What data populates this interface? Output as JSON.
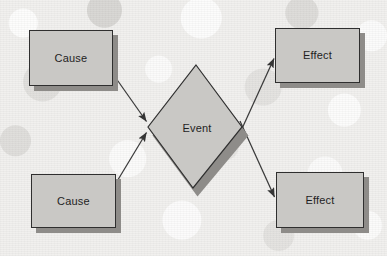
{
  "diagram": {
    "type": "cause-event-effect",
    "background_color": "#f1f0ee",
    "node_fill_color": "#c9c8c5",
    "node_border_color": "#2f2f2f",
    "node_shadow_color": "#8e8c89",
    "connector_color": "#3a3a3a",
    "nodes": [
      {
        "id": "cause-top",
        "label": "Cause",
        "shape": "rectangle",
        "x": 29,
        "y": 30,
        "width": 84,
        "height": 56
      },
      {
        "id": "cause-bottom",
        "label": "Cause",
        "shape": "rectangle",
        "x": 31,
        "y": 174,
        "width": 85,
        "height": 54
      },
      {
        "id": "event",
        "label": "Event",
        "shape": "diamond",
        "x": 148,
        "y": 65,
        "width": 94,
        "height": 123
      },
      {
        "id": "effect-top",
        "label": "Effect",
        "shape": "rectangle",
        "x": 275,
        "y": 28,
        "width": 85,
        "height": 55
      },
      {
        "id": "effect-bottom",
        "label": "Effect",
        "shape": "rectangle",
        "x": 276,
        "y": 172,
        "width": 88,
        "height": 56
      }
    ],
    "connectors": [
      {
        "id": "cause-top-to-event",
        "from": "cause-top",
        "to": "event",
        "arrowhead": "end"
      },
      {
        "id": "cause-bottom-to-event",
        "from": "cause-bottom",
        "to": "event",
        "arrowhead": "end"
      },
      {
        "id": "event-to-effect-top",
        "from": "event",
        "to": "effect-top",
        "arrowhead": "end"
      },
      {
        "id": "event-to-effect-bottom",
        "from": "event",
        "to": "effect-bottom",
        "arrowhead": "end"
      }
    ]
  }
}
